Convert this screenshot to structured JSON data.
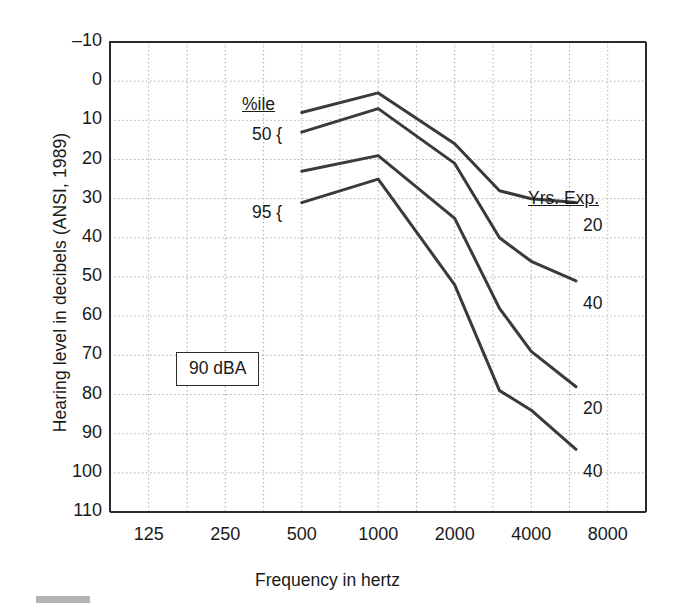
{
  "axes": {
    "ylabel": "Hearing level in decibels (ANSI, 1989)",
    "xlabel": "Frequency in hertz",
    "yticks": [
      "–10",
      "0",
      "10",
      "20",
      "30",
      "40",
      "50",
      "60",
      "70",
      "80",
      "90",
      "100",
      "110"
    ],
    "xticks": [
      "125",
      "250",
      "500",
      "1000",
      "2000",
      "4000",
      "8000"
    ]
  },
  "annotations": {
    "pctile_header": "%ile",
    "pct50": "50 {",
    "pct95": "95 {",
    "yrs_exp_header": "Yrs. Exp.",
    "label_20a": "20",
    "label_40a": "40",
    "label_20b": "20",
    "label_40b": "40",
    "dba_box": "90 dBA"
  },
  "colors": {
    "line": "#3a3a3a",
    "axis": "#2b2b2b",
    "grid": "#a9a9a9",
    "text": "#1a1a1a",
    "background": "#ffffff"
  },
  "chart_data": {
    "type": "line",
    "title": "",
    "xlabel": "Frequency in hertz",
    "ylabel": "Hearing level in decibels (ANSI, 1989)",
    "xscale": "log",
    "xlim": [
      88,
      11314
    ],
    "xtick_values": [
      125,
      250,
      500,
      1000,
      2000,
      4000,
      8000
    ],
    "ylim": [
      -10,
      110
    ],
    "yreversed": true,
    "ytick_values": [
      -10,
      0,
      10,
      20,
      30,
      40,
      50,
      60,
      70,
      80,
      90,
      100,
      110
    ],
    "grid": true,
    "grid_style": "dotted",
    "legend": "inline-end-labels",
    "exposure_level": "90 dBA",
    "series": [
      {
        "name": "50th %ile, 20 Yrs. Exp.",
        "percentile": 50,
        "years_exposure": 20,
        "x": [
          500,
          1000,
          2000,
          3000,
          4000,
          6000
        ],
        "y": [
          8,
          3,
          16,
          28,
          30,
          31
        ],
        "end_label": "20"
      },
      {
        "name": "50th %ile, 40 Yrs. Exp.",
        "percentile": 50,
        "years_exposure": 40,
        "x": [
          500,
          1000,
          2000,
          3000,
          4000,
          6000
        ],
        "y": [
          13,
          7,
          21,
          40,
          46,
          51
        ],
        "end_label": "40"
      },
      {
        "name": "95th %ile, 20 Yrs. Exp.",
        "percentile": 95,
        "years_exposure": 20,
        "x": [
          500,
          1000,
          2000,
          3000,
          4000,
          6000
        ],
        "y": [
          23,
          19,
          35,
          58,
          69,
          78
        ],
        "end_label": "20"
      },
      {
        "name": "95th %ile, 40 Yrs. Exp.",
        "percentile": 95,
        "years_exposure": 40,
        "x": [
          500,
          1000,
          2000,
          3000,
          4000,
          6000
        ],
        "y": [
          31,
          25,
          52,
          79,
          84,
          94
        ],
        "end_label": "40"
      }
    ]
  }
}
